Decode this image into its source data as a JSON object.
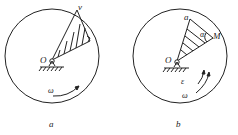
{
  "figures": [
    {
      "id": "a",
      "caption": "a",
      "labels": {
        "pivot": "O",
        "velocity": "v",
        "angular_velocity": "ω"
      }
    },
    {
      "id": "b",
      "caption": "b",
      "labels": {
        "pivot": "O",
        "point": "M",
        "acceleration": "a",
        "angle": "α",
        "angular_acceleration": "ε",
        "angular_velocity": "ω"
      }
    }
  ],
  "colors": {
    "stroke": "#222222",
    "background": "#ffffff"
  }
}
